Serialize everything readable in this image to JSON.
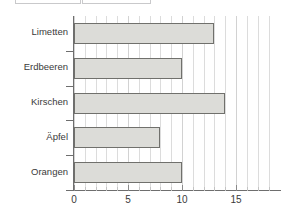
{
  "top_boxes": {
    "left_label": "",
    "right_label": ""
  },
  "chart_data": {
    "type": "bar",
    "orientation": "horizontal",
    "title": "",
    "subtitle": "",
    "xlabel": "",
    "ylabel": "",
    "categories": [
      "Limetten",
      "Erdbeeren",
      "Kirschen",
      "Äpfel",
      "Orangen"
    ],
    "values": [
      13,
      10,
      14,
      8,
      10
    ],
    "series": [
      {
        "name": "",
        "values": [
          13,
          10,
          14,
          8,
          10
        ]
      }
    ],
    "xlim": [
      0,
      18.6
    ],
    "ylim": [
      0,
      5
    ],
    "xticks": [
      0,
      5,
      10,
      15
    ],
    "xtick_labels": [
      "0",
      "5",
      "10",
      "15"
    ],
    "xtick_minor_step": 1,
    "grid": true,
    "grid_axis": "x",
    "legend": false,
    "legend_position": "none",
    "annotations": [],
    "colors": {
      "bar_fill": "#dcdcd8",
      "bar_border": "#70706c",
      "gridline": "#dcdcdc",
      "axis": "#6e6e6e",
      "text": "#3a3a3a",
      "background": "#ffffff"
    }
  }
}
